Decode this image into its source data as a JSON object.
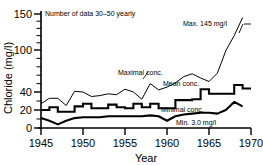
{
  "chart_data": {
    "type": "line",
    "title": "",
    "xlabel": "Year",
    "ylabel": "Chloride (mg/l)",
    "xlim": [
      1945,
      1970
    ],
    "ylim": [
      0,
      150
    ],
    "grid": false,
    "legend_position": "inline-annotations",
    "y_axis_note": "broken (non-linear) axis: 0-40 expanded, 40-150 compressed",
    "xticks": [
      "1945",
      "1950",
      "1955",
      "1960",
      "1965",
      "1970"
    ],
    "yticks": [
      "0",
      "20",
      "40",
      "100",
      "150"
    ],
    "x": [
      1945,
      1946,
      1947,
      1948,
      1949,
      1950,
      1951,
      1952,
      1953,
      1954,
      1955,
      1956,
      1957,
      1958,
      1959,
      1960,
      1961,
      1962,
      1963,
      1964,
      1965,
      1966,
      1967,
      1968,
      1969
    ],
    "series": [
      {
        "name": "Maximal conc.",
        "style": "thin-line",
        "values": [
          27,
          33,
          33,
          25,
          41,
          40,
          35,
          36,
          38,
          37,
          44,
          40,
          32,
          52,
          43,
          47,
          53,
          62,
          66,
          60,
          55,
          67,
          99,
          120,
          145
        ]
      },
      {
        "name": "Mean conc.",
        "style": "thick-step",
        "values": [
          20,
          23,
          18,
          18,
          24,
          27,
          22,
          22,
          26,
          23,
          22,
          27,
          23,
          27,
          22,
          22,
          31,
          31,
          32,
          44,
          38,
          38,
          38,
          50,
          45
        ]
      },
      {
        "name": "Minimal conc.",
        "style": "thick-line",
        "values": [
          11,
          8,
          4,
          8,
          11,
          12,
          12,
          12,
          13,
          13,
          13,
          13,
          13,
          14,
          13,
          8,
          13,
          15,
          16,
          17,
          17,
          16,
          20,
          29,
          24
        ]
      }
    ],
    "annotations": [
      {
        "name": "data-count-note",
        "text": "Number of data 30–50 yearly"
      },
      {
        "name": "max-value-label",
        "text": "Max. 145 mg/l"
      },
      {
        "name": "min-value-label",
        "text": "Min. 3.0 mg/l"
      },
      {
        "name": "maximal-series-label",
        "text": "Maximal conc."
      },
      {
        "name": "mean-series-label",
        "text": "Mean conc."
      },
      {
        "name": "minimal-series-label",
        "text": "Minimal conc."
      }
    ],
    "colors": {
      "line": "#000000",
      "background": "#ffffff"
    }
  },
  "axes": {
    "y_title": "Chloride (mg/l)",
    "x_title": "Year",
    "y_ticks": [
      {
        "label": "150"
      },
      {
        "label": "100"
      },
      {
        "label": "40"
      },
      {
        "label": "20"
      },
      {
        "label": "0"
      }
    ],
    "x_ticks": [
      {
        "label": "1945"
      },
      {
        "label": "1950"
      },
      {
        "label": "1955"
      },
      {
        "label": "1960"
      },
      {
        "label": "1965"
      },
      {
        "label": "1970"
      }
    ]
  },
  "labels": {
    "data_count": "Number of data 30–50 yearly",
    "max_callout": "Max. 145 mg/l",
    "min_callout": "Min. 3.0 mg/l",
    "maximal_conc": "Maximal conc.",
    "mean_conc": "Mean conc.",
    "minimal_conc": "Minimal conc."
  }
}
